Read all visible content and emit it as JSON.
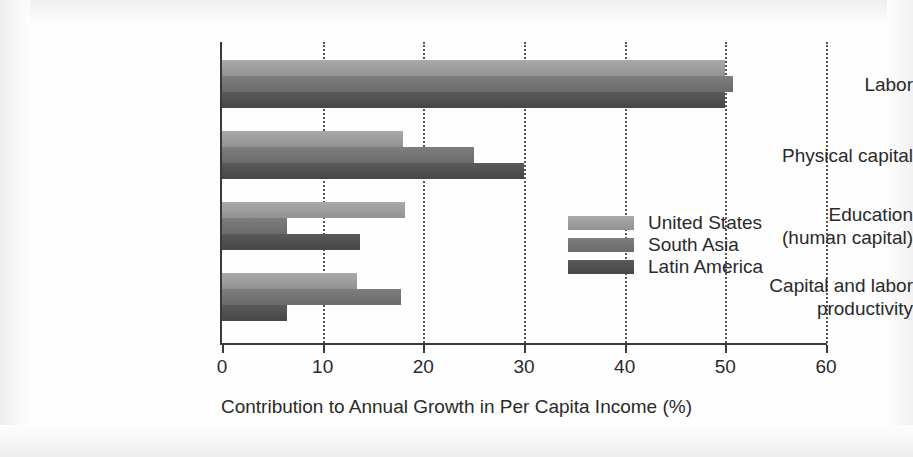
{
  "chart_data": {
    "type": "bar",
    "orientation": "horizontal",
    "title": "",
    "xlabel": "Contribution to Annual Growth in Per Capita Income (%)",
    "ylabel": "",
    "xlim": [
      0,
      60
    ],
    "xticks": [
      0,
      10,
      20,
      30,
      40,
      50,
      60
    ],
    "xtick_labels": [
      "0",
      "10",
      "20",
      "30",
      "40",
      "50",
      "60"
    ],
    "grid": "vertical dotted gridlines at each x tick",
    "legend_position": "inside right-center",
    "categories": [
      "Labor",
      "Physical capital",
      "Education\n(human capital)",
      "Capital and labor\nproductivity"
    ],
    "series": [
      {
        "name": "United States",
        "color": "#9d9d9d",
        "values": [
          50.0,
          18.0,
          18.2,
          13.4
        ]
      },
      {
        "name": "South Asia",
        "color": "#737373",
        "values": [
          50.8,
          25.0,
          6.5,
          17.8
        ]
      },
      {
        "name": "Latin America",
        "color": "#4f4f4f",
        "values": [
          50.0,
          30.0,
          13.7,
          6.5
        ]
      }
    ]
  },
  "axis": {
    "tick_labels": [
      "0",
      "10",
      "20",
      "30",
      "40",
      "50",
      "60"
    ],
    "x_title": "Contribution to Annual Growth in Per Capita Income (%)"
  },
  "categories": [
    {
      "line1": "Labor",
      "line2": ""
    },
    {
      "line1": "Physical capital",
      "line2": ""
    },
    {
      "line1": "Education",
      "line2": "(human capital)"
    },
    {
      "line1": "Capital and labor",
      "line2": "productivity"
    }
  ],
  "legend": {
    "items": [
      {
        "label": "United States"
      },
      {
        "label": "South Asia"
      },
      {
        "label": "Latin America"
      }
    ]
  }
}
